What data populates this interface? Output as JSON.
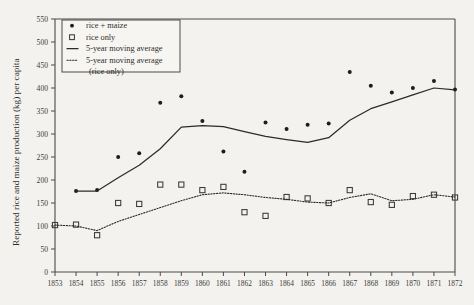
{
  "chart_data": {
    "type": "scatter",
    "title": "",
    "xlabel": "",
    "ylabel": "Reported rice and maize production (kg) per capita",
    "xlim": [
      1853,
      1872
    ],
    "ylim": [
      0,
      550
    ],
    "ytick_step": 50,
    "grid": false,
    "legend_position": "top-left",
    "x": [
      1853,
      1854,
      1855,
      1856,
      1857,
      1858,
      1859,
      1860,
      1861,
      1862,
      1863,
      1864,
      1865,
      1866,
      1867,
      1868,
      1869,
      1870,
      1871,
      1872
    ],
    "xticks": [
      "1853",
      "1854",
      "1855",
      "1856",
      "1857",
      "1858",
      "1859",
      "1860",
      "1861",
      "1862",
      "1863",
      "1864",
      "1865",
      "1866",
      "1867",
      "1868",
      "1869",
      "1870",
      "1871",
      "1872"
    ],
    "yticks": [
      "0",
      "50",
      "100",
      "150",
      "200",
      "250",
      "300",
      "350",
      "400",
      "450",
      "500",
      "550"
    ],
    "series": [
      {
        "name": "rice + maize",
        "marker": "filled-circle",
        "x": [
          1854,
          1855,
          1856,
          1857,
          1858,
          1859,
          1860,
          1861,
          1862,
          1863,
          1864,
          1865,
          1866,
          1867,
          1868,
          1869,
          1870,
          1871,
          1872
        ],
        "values": [
          176,
          178,
          250,
          258,
          368,
          382,
          328,
          262,
          218,
          325,
          311,
          320,
          323,
          435,
          405,
          390,
          400,
          415,
          397
        ]
      },
      {
        "name": "rice only",
        "marker": "open-square",
        "x": [
          1853,
          1854,
          1855,
          1856,
          1857,
          1858,
          1859,
          1860,
          1861,
          1862,
          1863,
          1864,
          1865,
          1866,
          1867,
          1868,
          1869,
          1870,
          1871,
          1872
        ],
        "values": [
          102,
          103,
          80,
          150,
          148,
          190,
          190,
          178,
          185,
          130,
          122,
          163,
          160,
          150,
          178,
          152,
          146,
          165,
          168,
          162
        ]
      },
      {
        "name": "5-year moving average",
        "marker": "solid-line",
        "x": [
          1854,
          1855,
          1856,
          1857,
          1858,
          1859,
          1860,
          1861,
          1862,
          1863,
          1864,
          1865,
          1866,
          1867,
          1868,
          1869,
          1870,
          1871,
          1872
        ],
        "values": [
          176,
          176,
          205,
          232,
          268,
          315,
          318,
          316,
          305,
          295,
          288,
          282,
          292,
          330,
          355,
          370,
          385,
          400,
          396
        ]
      },
      {
        "name": "5-year moving average (rice only)",
        "marker": "dotted-line",
        "x": [
          1853,
          1854,
          1855,
          1856,
          1857,
          1858,
          1859,
          1860,
          1861,
          1862,
          1863,
          1864,
          1865,
          1866,
          1867,
          1868,
          1869,
          1870,
          1871,
          1872
        ],
        "values": [
          102,
          100,
          90,
          110,
          125,
          140,
          155,
          168,
          172,
          168,
          162,
          158,
          152,
          150,
          162,
          170,
          155,
          158,
          168,
          163
        ]
      }
    ]
  },
  "legend": {
    "items": [
      {
        "label": "rice + maize",
        "marker": "filled-circle"
      },
      {
        "label": "rice only",
        "marker": "open-square"
      },
      {
        "label": "5-year moving average",
        "marker": "solid-line"
      },
      {
        "label": "5-year moving average",
        "label2": "(rice only)",
        "marker": "dotted-line"
      }
    ]
  },
  "axes": {
    "y_title": "Reported rice and maize production (kg) per capita"
  }
}
